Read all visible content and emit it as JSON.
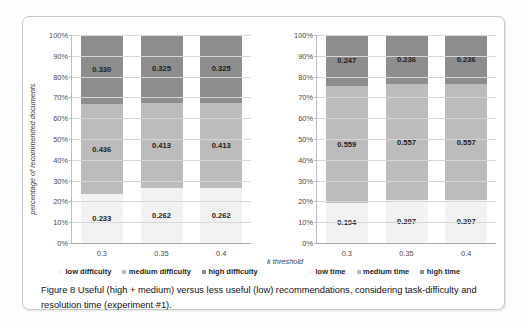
{
  "figure": {
    "caption": "Figure 8 Useful (high + medium) versus less useful (low) recommendations, considering task-difficulty and resolution time (experiment #1).",
    "colors": {
      "high": "#8d8d8d",
      "medium": "#bcbcbc",
      "low": "#f2f2f2",
      "gridline": "#d6d6d6",
      "axis": "#a9a9a9",
      "text": "#232323"
    }
  },
  "chart_data": [
    {
      "type": "bar",
      "id": "task-difficulty",
      "title": "",
      "stacked": true,
      "stack_mode": "percent",
      "xlabel": "",
      "ylabel": "percentage of recommended documents",
      "categories": [
        "0.3",
        "0.35",
        "0.4"
      ],
      "ylim": [
        0,
        100
      ],
      "ytick_labels": [
        "0%",
        "10%",
        "20%",
        "30%",
        "40%",
        "50%",
        "60%",
        "70%",
        "80%",
        "90%",
        "100%"
      ],
      "grid": true,
      "legend_position": "bottom",
      "series": [
        {
          "name": "low difficulty",
          "key": "low",
          "values": [
            0.233,
            0.262,
            0.262
          ],
          "labels": [
            "0.233",
            "0.262",
            "0.262"
          ],
          "color": "#f2f2f2"
        },
        {
          "name": "medium difficulty",
          "key": "med",
          "values": [
            0.436,
            0.413,
            0.413
          ],
          "labels": [
            "0.436",
            "0.413",
            "0.413"
          ],
          "color": "#bcbcbc"
        },
        {
          "name": "high difficulty",
          "key": "high",
          "values": [
            0.33,
            0.325,
            0.325
          ],
          "labels": [
            "0.330",
            "0.325",
            "0.325"
          ],
          "color": "#8d8d8d"
        }
      ]
    },
    {
      "type": "bar",
      "id": "resolution-time",
      "title": "",
      "stacked": true,
      "stack_mode": "percent",
      "xlabel": "k threshold",
      "ylabel": "",
      "categories": [
        "0.3",
        "0.35",
        "0.4"
      ],
      "ylim": [
        0,
        100
      ],
      "ytick_labels": [
        "0%",
        "10%",
        "20%",
        "30%",
        "40%",
        "50%",
        "60%",
        "70%",
        "80%",
        "90%",
        "100%"
      ],
      "grid": true,
      "legend_position": "bottom",
      "series": [
        {
          "name": "low time",
          "key": "low",
          "values": [
            0.194,
            0.207,
            0.207
          ],
          "labels": [
            "0.194",
            "0.207",
            "0.207"
          ],
          "color": "#f2f2f2"
        },
        {
          "name": "medium time",
          "key": "med",
          "values": [
            0.559,
            0.557,
            0.557
          ],
          "labels": [
            "0.559",
            "0.557",
            "0.557"
          ],
          "color": "#bcbcbc"
        },
        {
          "name": "high time",
          "key": "high",
          "values": [
            0.247,
            0.236,
            0.236
          ],
          "labels": [
            "0.247",
            "0.236",
            "0.236"
          ],
          "color": "#8d8d8d"
        }
      ]
    }
  ]
}
